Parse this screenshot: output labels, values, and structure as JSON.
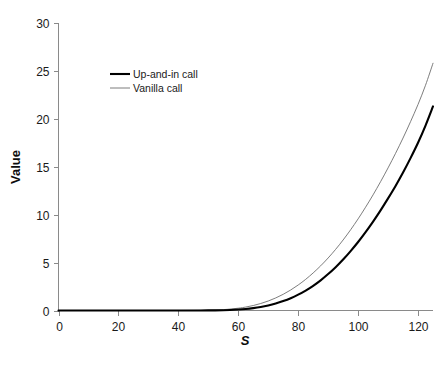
{
  "chart_data": {
    "type": "line",
    "title": "",
    "subtitle": "",
    "xlabel": "S",
    "ylabel": "Value",
    "xlim": [
      0,
      125
    ],
    "ylim": [
      0,
      30
    ],
    "xticks": [
      0,
      20,
      40,
      60,
      80,
      100,
      120
    ],
    "yticks": [
      0,
      5,
      10,
      15,
      20,
      25,
      30
    ],
    "xtick_labels": [
      "0",
      "20",
      "40",
      "60",
      "80",
      "100",
      "120"
    ],
    "ytick_labels": [
      "0",
      "5",
      "10",
      "15",
      "20",
      "25",
      "30"
    ],
    "grid": false,
    "legend_position": "upper-left-inset",
    "x": [
      0,
      5,
      10,
      15,
      20,
      25,
      30,
      35,
      40,
      45,
      50,
      55,
      60,
      62.5,
      65,
      67.5,
      70,
      72.5,
      75,
      77.5,
      80,
      82.5,
      85,
      87.5,
      90,
      92.5,
      95,
      97.5,
      100,
      102.5,
      105,
      107.5,
      110,
      112.5,
      115,
      117.5,
      120,
      122.5,
      125
    ],
    "series": [
      {
        "name": "Up-and-in call",
        "color": "#000000",
        "line_width": 2.1,
        "values": [
          0,
          0,
          0,
          0,
          0,
          0,
          0,
          0,
          0,
          0,
          0.01,
          0.03,
          0.1,
          0.16,
          0.25,
          0.37,
          0.53,
          0.73,
          0.98,
          1.28,
          1.65,
          2.08,
          2.58,
          3.15,
          3.8,
          4.52,
          5.32,
          6.2,
          7.15,
          8.18,
          9.28,
          10.45,
          11.7,
          13.0,
          14.4,
          15.9,
          17.5,
          19.3,
          21.3
        ]
      },
      {
        "name": "Vanilla call",
        "color": "#6e6e6e",
        "line_width": 0.9,
        "values": [
          0,
          0,
          0,
          0,
          0,
          0,
          0,
          0,
          0,
          0.01,
          0.03,
          0.09,
          0.24,
          0.36,
          0.52,
          0.73,
          0.99,
          1.31,
          1.69,
          2.14,
          2.66,
          3.25,
          3.92,
          4.66,
          5.48,
          6.38,
          7.36,
          8.42,
          9.56,
          10.78,
          12.07,
          13.44,
          14.88,
          16.4,
          18.0,
          19.7,
          21.5,
          23.5,
          25.8
        ]
      }
    ],
    "legend_entries": [
      {
        "label": "Up-and-in call",
        "color": "#000000",
        "line_width": 2.1
      },
      {
        "label": "Vanilla call",
        "color": "#6e6e6e",
        "line_width": 0.9
      }
    ]
  }
}
